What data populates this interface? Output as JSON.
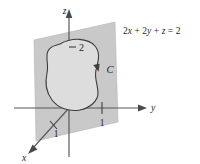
{
  "figure": {
    "kind": "3d-coordinate-diagram",
    "background_color": "#ffffff",
    "plane_fill_color": "#c9c9c9",
    "region_fill_color": "#dcdcdc",
    "axis_color": "#4f4f4f",
    "curve_color": "#3a3a3a",
    "text_color": "#242424"
  },
  "axes": {
    "z": {
      "label": "z",
      "arrow": "up"
    },
    "y": {
      "label": "y",
      "arrow": "right"
    },
    "x": {
      "label": "x",
      "arrow": "down-left"
    }
  },
  "tick_labels": {
    "z_intercept": "2",
    "y_intercept": "1",
    "x_intercept": "1"
  },
  "curve": {
    "label": "C",
    "orientation": "counterclockwise",
    "has_direction_arrow": true
  },
  "plane": {
    "equation_parts": {
      "term1_coef": "2",
      "term1_var": "x",
      "plus1": "+",
      "term2_coef": "2",
      "term2_var": "y",
      "plus2": "+",
      "term3_var": "z",
      "equals": "=",
      "rhs": "2"
    },
    "equation_text": "2x + 2y + z = 2"
  }
}
